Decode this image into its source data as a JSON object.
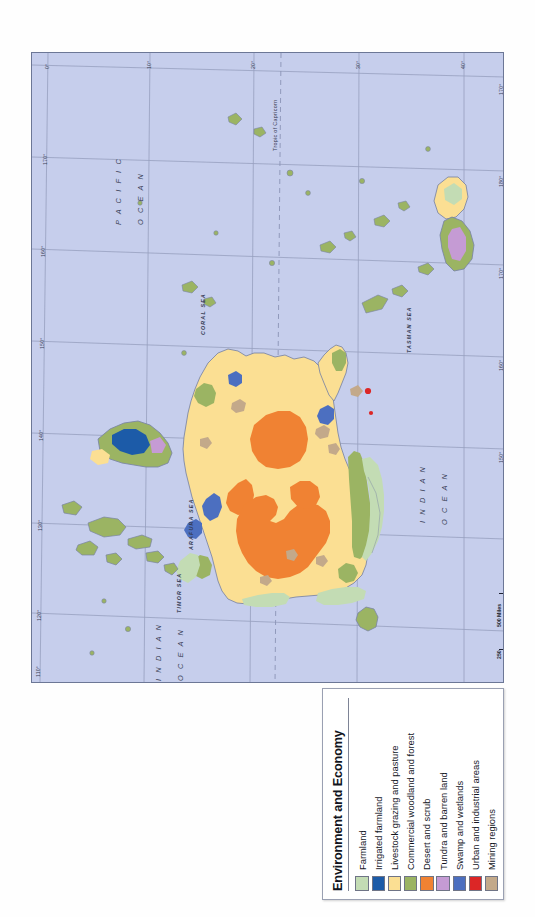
{
  "legend": {
    "title": "Environment and Economy",
    "items": [
      {
        "label": "Farmland",
        "color": "#c3dcb4"
      },
      {
        "label": "Irrigated farmland",
        "color": "#1c5ba8"
      },
      {
        "label": "Livestock grazing and pasture",
        "color": "#fbdf93"
      },
      {
        "label": "Commercial woodland and forest",
        "color": "#9bb463"
      },
      {
        "label": "Desert and scrub",
        "color": "#f08233"
      },
      {
        "label": "Tundra and barren land",
        "color": "#c59bd4"
      },
      {
        "label": "Swamp and wetlands",
        "color": "#4c6fc0"
      },
      {
        "label": "Urban and industrial areas",
        "color": "#dc2626"
      },
      {
        "label": "Mining regions",
        "color": "#c3a98a"
      }
    ]
  },
  "scale_bar": {
    "miles_label": "500 Miles",
    "km_label": "500 Kilometers",
    "miles_ticks": [
      "0",
      "250",
      "500 Miles"
    ],
    "km_ticks": [
      "0",
      "250",
      "500 Kilometers"
    ]
  },
  "map": {
    "water_labels": [
      {
        "text": "P A C I F I C"
      },
      {
        "text": "O C E A N"
      },
      {
        "text": "CORAL SEA"
      },
      {
        "text": "TASMAN SEA"
      },
      {
        "text": "ARAFURA SEA"
      },
      {
        "text": "TIMOR SEA"
      },
      {
        "text": "I N D I A N"
      },
      {
        "text": "O C E A N"
      },
      {
        "text": "I N D I A N"
      },
      {
        "text": "O C E A N"
      }
    ],
    "tropic_label": "Tropic of Capricorn",
    "lat_ticks": [
      "0°",
      "10°",
      "20°",
      "30°",
      "40°"
    ],
    "lon_ticks_left": [
      "170°",
      "160°",
      "150°",
      "140°",
      "130°",
      "120°",
      "110°"
    ],
    "lon_ticks_right": [
      "170°",
      "180°",
      "170°",
      "160°",
      "150°",
      "140°",
      "130°",
      "120°"
    ],
    "colors": {
      "ocean": "#c6ceec",
      "grazing": "#fbdf93",
      "desert": "#f08233",
      "woodland": "#9bb463",
      "farmland": "#c3dcb4",
      "wetlands": "#4c6fc0",
      "irrigated": "#1c5ba8",
      "tundra": "#c59bd4",
      "mining": "#c3a98a",
      "urban": "#dc2626",
      "coast": "#7a84a4"
    }
  }
}
